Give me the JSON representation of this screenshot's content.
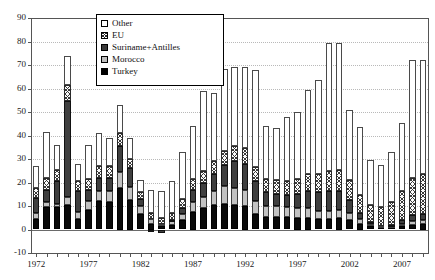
{
  "chart_data": {
    "type": "bar",
    "title": "",
    "subtitle": "",
    "xlabel": "",
    "ylabel": "",
    "stacked": true,
    "grid": true,
    "legend_position": "top-center",
    "ylim": [
      -10,
      90
    ],
    "ytick_labels": [
      "90",
      "80",
      "70",
      "60",
      "50",
      "40",
      "30",
      "20",
      "10",
      "0",
      "-10"
    ],
    "ytick_values": [
      90,
      80,
      70,
      60,
      50,
      40,
      30,
      20,
      10,
      0,
      -10
    ],
    "xlim": [
      1972,
      2009
    ],
    "categories": [
      1972,
      1973,
      1974,
      1975,
      1976,
      1977,
      1978,
      1979,
      1980,
      1981,
      1982,
      1983,
      1984,
      1985,
      1986,
      1987,
      1988,
      1989,
      1990,
      1991,
      1992,
      1993,
      1994,
      1995,
      1996,
      1997,
      1998,
      1999,
      2000,
      2001,
      2002,
      2003,
      2004,
      2005,
      2006,
      2007,
      2008,
      2009
    ],
    "xtick_labels": [
      "1972",
      "1977",
      "1982",
      "1987",
      "1992",
      "1997",
      "2002",
      "2007"
    ],
    "xtick_label_values": [
      1972,
      1977,
      1982,
      1987,
      1992,
      1997,
      2002,
      2007
    ],
    "series": [
      {
        "name": "Turkey",
        "color": "#0a0a0a",
        "pattern": "solid-black",
        "values": [
          4.5,
          9.5,
          9.5,
          10.5,
          4.5,
          8.5,
          12.0,
          11.5,
          17.5,
          12.5,
          6.5,
          2.5,
          1.5,
          2.0,
          4.0,
          7.5,
          9.0,
          10.5,
          11.0,
          10.5,
          10.0,
          6.5,
          5.5,
          5.5,
          5.5,
          5.0,
          5.0,
          4.5,
          4.5,
          5.0,
          4.0,
          2.5,
          1.5,
          1.0,
          1.0,
          1.5,
          2.0,
          2.5
        ]
      },
      {
        "name": "Morocco",
        "color": "#c2c2c2",
        "pattern": "light-gray",
        "values": [
          2.5,
          2.0,
          1.5,
          3.5,
          3.0,
          3.5,
          4.5,
          5.0,
          7.0,
          5.5,
          3.5,
          2.0,
          1.0,
          1.5,
          2.5,
          4.0,
          5.0,
          6.0,
          7.5,
          7.0,
          7.0,
          5.5,
          4.5,
          4.5,
          4.0,
          4.0,
          4.0,
          3.5,
          3.5,
          3.5,
          3.0,
          2.0,
          1.0,
          0.5,
          0.5,
          1.0,
          1.5,
          1.5
        ]
      },
      {
        "name": "Suriname+Antilles",
        "color": "#3f3f3f",
        "pattern": "dark-gray",
        "values": [
          6.5,
          5.5,
          9.5,
          40.5,
          9.0,
          5.0,
          5.5,
          5.5,
          11.0,
          8.0,
          3.0,
          -1.0,
          -1.5,
          0.5,
          2.5,
          5.5,
          6.0,
          7.0,
          9.0,
          11.5,
          11.0,
          8.5,
          6.0,
          5.0,
          5.0,
          6.0,
          7.5,
          8.0,
          8.5,
          8.0,
          5.5,
          2.5,
          0.5,
          0.0,
          0.5,
          1.5,
          2.5,
          2.5
        ]
      },
      {
        "name": "EU",
        "color": "#3a3a3a",
        "pattern": "checkered",
        "values": [
          4.0,
          5.0,
          5.0,
          7.0,
          4.0,
          4.5,
          5.0,
          5.0,
          5.5,
          4.0,
          3.0,
          2.5,
          2.5,
          3.0,
          4.0,
          4.5,
          5.0,
          5.5,
          6.0,
          6.5,
          6.5,
          6.0,
          5.5,
          6.0,
          6.0,
          6.5,
          7.0,
          7.5,
          8.5,
          9.0,
          8.5,
          7.5,
          7.5,
          8.0,
          9.5,
          12.5,
          16.0,
          17.0
        ]
      },
      {
        "name": "Other",
        "color": "#ffffff",
        "pattern": "white",
        "values": [
          9.5,
          19.5,
          10.5,
          12.5,
          7.5,
          14.5,
          14.0,
          12.0,
          12.0,
          9.0,
          5.0,
          10.0,
          11.5,
          13.5,
          20.0,
          22.5,
          34.0,
          29.0,
          35.0,
          33.5,
          34.5,
          41.5,
          22.5,
          22.0,
          27.5,
          28.5,
          36.0,
          40.0,
          54.5,
          54.0,
          30.0,
          29.0,
          19.0,
          18.0,
          21.5,
          29.0,
          50.0,
          48.5
        ]
      }
    ],
    "totals": [
      27.0,
      41.5,
      36.0,
      74.0,
      28.0,
      36.0,
      41.0,
      39.0,
      53.0,
      39.0,
      21.0,
      16.0,
      15.0,
      20.5,
      33.0,
      44.0,
      59.0,
      58.0,
      68.5,
      69.0,
      69.0,
      68.0,
      44.0,
      43.0,
      48.0,
      50.0,
      59.5,
      63.5,
      79.5,
      79.5,
      51.0,
      43.5,
      29.5,
      27.5,
      33.0,
      45.5,
      72.0,
      72.0
    ]
  },
  "legend": {
    "items": [
      {
        "label": "Other",
        "swatch_class": "sw-other"
      },
      {
        "label": "EU",
        "swatch_class": "sw-eu"
      },
      {
        "label": "Suriname+Antilles",
        "swatch_class": "sw-sur"
      },
      {
        "label": "Morocco",
        "swatch_class": "sw-mor"
      },
      {
        "label": "Turkey",
        "swatch_class": "sw-tur"
      }
    ]
  }
}
